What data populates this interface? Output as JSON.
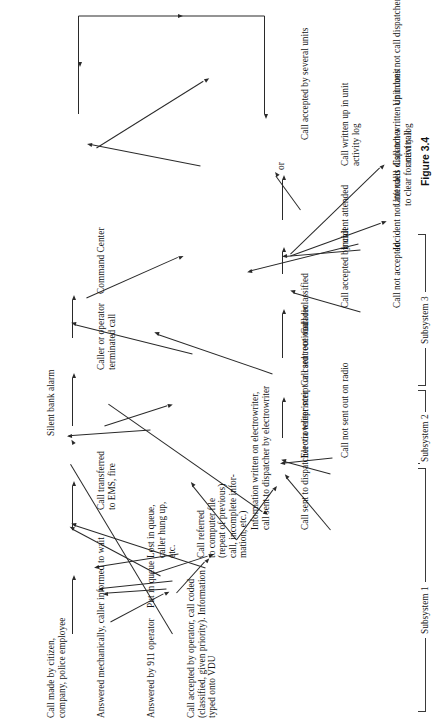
{
  "figure": {
    "caption": "Figure 3.4",
    "orientation_deg": -90
  },
  "nodes": [
    {
      "id": "call_made",
      "text": "Call made by citizen,\ncompany, police employee",
      "x": 8,
      "y": 46
    },
    {
      "id": "answered_mech",
      "text": "Answered mechanically, caller informed to wait",
      "x": 8,
      "y": 96
    },
    {
      "id": "answered_911",
      "text": "Answered by 911 operator",
      "x": 8,
      "y": 146
    },
    {
      "id": "call_accepted_op",
      "text": "Call accepted by operator, call coded\n(classified, given priority). Information\ntyped onto VDU",
      "x": 8,
      "y": 186
    },
    {
      "id": "put_in_queue",
      "text": "Put in queue",
      "x": 118,
      "y": 146
    },
    {
      "id": "lost_in_queue",
      "text": "Lost in queue,\ncaller hung up,\netc.",
      "x": 168,
      "y": 146
    },
    {
      "id": "call_referred",
      "text": "Call referred\nto computer file\n(repeat of previous)\ncall, incomplete infor-\nmation, etc.)",
      "x": 168,
      "y": 196
    },
    {
      "id": "silent_alarm",
      "text": "Silent bank alarm",
      "x": 290,
      "y": 46
    },
    {
      "id": "call_transferred",
      "text": "Call transferred\nto EMS, fire",
      "x": 216,
      "y": 96
    },
    {
      "id": "caller_terminated",
      "text": "Caller or operator\nterminated call",
      "x": 356,
      "y": 96
    },
    {
      "id": "info_electrowriter",
      "text": "Information written on electrowriter,\ncall sent to dispatcher by electrowriter",
      "x": 196,
      "y": 250
    },
    {
      "id": "call_sent_disp",
      "text": "Call sent to dispatcher via teleprinter",
      "x": 196,
      "y": 300
    },
    {
      "id": "electrowriter_script",
      "text": "Electrowriter script or card received",
      "x": 268,
      "y": 300
    },
    {
      "id": "call_not_sent",
      "text": "Call not sent out on radio",
      "x": 268,
      "y": 340
    },
    {
      "id": "call_sent_radio",
      "text": "Call sent out on radio",
      "x": 340,
      "y": 300
    },
    {
      "id": "call_reclassified",
      "text": "Call reclassified",
      "x": 392,
      "y": 300
    },
    {
      "id": "command_center",
      "text": "Command Center",
      "x": 432,
      "y": 96
    },
    {
      "id": "call_accepted_unit",
      "text": "Call accepted by unit",
      "x": 418,
      "y": 340
    },
    {
      "id": "call_not_accepted",
      "text": "Call not accepted",
      "x": 418,
      "y": 392
    },
    {
      "id": "incident_attended",
      "text": "Incident attended",
      "x": 476,
      "y": 340
    },
    {
      "id": "incident_not_attended",
      "text": "Incident not attended",
      "x": 476,
      "y": 392
    },
    {
      "id": "unit_calls_disp",
      "text": "Unit calls dispatcher\nto clear for next call",
      "x": 520,
      "y": 392
    },
    {
      "id": "call_written_up",
      "text": "Call written up in unit\nactivity log",
      "x": 560,
      "y": 340
    },
    {
      "id": "call_not_written",
      "text": "Call not written up in unit\nactivity log",
      "x": 560,
      "y": 392
    },
    {
      "id": "or_label",
      "text": "or",
      "x": 556,
      "y": 206
    },
    {
      "id": "accepted_several",
      "text": "Call accepted by several units",
      "x": 586,
      "y": 300
    },
    {
      "id": "unit_not_clear",
      "text": "Unit does not call dispatcher to clear",
      "x": 620,
      "y": 392
    }
  ],
  "brackets": [
    {
      "id": "subsystem1",
      "label": "Subsystem 1",
      "x": 14,
      "w": 242
    },
    {
      "id": "subsystem2",
      "label": "Subsystem 2",
      "x": 262,
      "w": 72
    },
    {
      "id": "subsystem3",
      "label": "Subsystem 3",
      "x": 340,
      "w": 150
    }
  ],
  "colors": {
    "background": "#ffffff",
    "ink": "#141414",
    "stroke": "#2a2a2a"
  }
}
